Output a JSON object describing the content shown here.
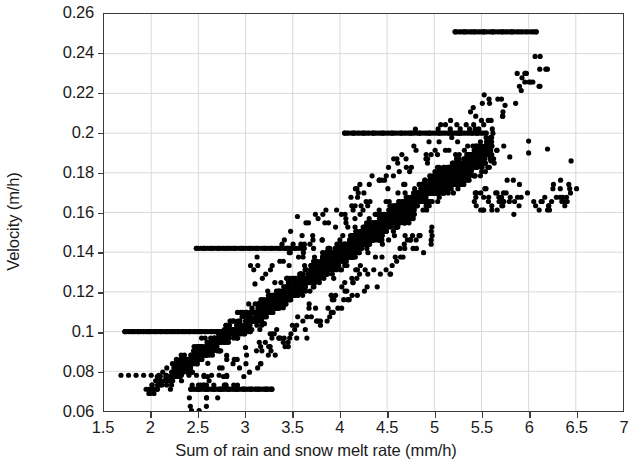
{
  "chart_data": {
    "type": "scatter",
    "title": "",
    "xlabel": "Sum of rain and snow melt rate (mm/h)",
    "ylabel": "Velocity (m/h)",
    "xlim": [
      1.5,
      7
    ],
    "ylim": [
      0.06,
      0.26
    ],
    "xticks": [
      1.5,
      2,
      2.5,
      3,
      3.5,
      4,
      4.5,
      5,
      5.5,
      6,
      6.5,
      7
    ],
    "xtick_labels": [
      "1.5",
      "2",
      "2.5",
      "3",
      "3.5",
      "4",
      "4.5",
      "5",
      "5.5",
      "6",
      "6.5",
      "7"
    ],
    "yticks": [
      0.06,
      0.08,
      0.1,
      0.12,
      0.14,
      0.16,
      0.18,
      0.2,
      0.22,
      0.24,
      0.26
    ],
    "ytick_labels": [
      "0.06",
      "0.08",
      "0.1",
      "0.12",
      "0.14",
      "0.16",
      "0.18",
      "0.2",
      "0.22",
      "0.24",
      "0.26"
    ],
    "grid": true,
    "legend": null,
    "marker": {
      "shape": "circle",
      "size_px": 5.2,
      "color": "#000000",
      "filled": true
    },
    "series": [
      {
        "name": "velocity vs rain and snow melt rate",
        "description": "Dense positively-correlated point cloud; velocity rises from about 0.07 m/h at 2 mm/h to about 0.20 m/h at 6 mm/h. Several horizontal quantization bands are visible at 0.251, 0.200, 0.142, 0.100 and 0.071 m/h.",
        "n_points_approx": 1900,
        "bands": [
          {
            "y": 0.251,
            "x_from": 5.22,
            "x_to": 6.08,
            "note": "saturated top band"
          },
          {
            "y": 0.2,
            "x_from": 4.05,
            "x_to": 5.55,
            "note": "dense flat band"
          },
          {
            "y": 0.142,
            "x_from": 2.48,
            "x_to": 3.62,
            "note": "flat band"
          },
          {
            "y": 0.1,
            "x_from": 1.72,
            "x_to": 3.05,
            "note": "flat band"
          },
          {
            "y": 0.071,
            "x_from": 2.42,
            "x_to": 3.28,
            "note": "lowest flat band"
          }
        ],
        "trend": {
          "type": "linear",
          "slope": 0.0335,
          "intercept": 0.0045
        },
        "points": [
          [
            1.72,
            0.1
          ],
          [
            1.8,
            0.1
          ],
          [
            1.86,
            0.1
          ],
          [
            1.92,
            0.1
          ],
          [
            1.98,
            0.1
          ],
          [
            2.04,
            0.1
          ],
          [
            2.1,
            0.1
          ],
          [
            2.16,
            0.1
          ],
          [
            2.22,
            0.1
          ],
          [
            2.28,
            0.1
          ],
          [
            2.34,
            0.1
          ],
          [
            2.4,
            0.1
          ],
          [
            2.46,
            0.1
          ],
          [
            2.52,
            0.1
          ],
          [
            2.58,
            0.1
          ],
          [
            2.64,
            0.1
          ],
          [
            2.7,
            0.1
          ],
          [
            2.76,
            0.1
          ],
          [
            2.82,
            0.1
          ],
          [
            2.88,
            0.1
          ],
          [
            2.94,
            0.1
          ],
          [
            3.0,
            0.1
          ],
          [
            3.05,
            0.1
          ],
          [
            1.68,
            0.078
          ],
          [
            1.76,
            0.078
          ],
          [
            1.84,
            0.078
          ],
          [
            1.92,
            0.078
          ],
          [
            2.0,
            0.078
          ],
          [
            2.08,
            0.078
          ],
          [
            2.16,
            0.078
          ],
          [
            2.24,
            0.078
          ],
          [
            2.32,
            0.078
          ],
          [
            2.4,
            0.078
          ],
          [
            2.48,
            0.078
          ],
          [
            2.56,
            0.078
          ],
          [
            2.64,
            0.078
          ],
          [
            2.72,
            0.078
          ],
          [
            2.8,
            0.078
          ],
          [
            2.42,
            0.071
          ],
          [
            2.5,
            0.071
          ],
          [
            2.58,
            0.071
          ],
          [
            2.66,
            0.071
          ],
          [
            2.74,
            0.071
          ],
          [
            2.82,
            0.071
          ],
          [
            2.9,
            0.071
          ],
          [
            2.98,
            0.071
          ],
          [
            3.06,
            0.071
          ],
          [
            3.14,
            0.071
          ],
          [
            3.22,
            0.071
          ],
          [
            3.28,
            0.071
          ],
          [
            2.48,
            0.142
          ],
          [
            2.56,
            0.142
          ],
          [
            2.64,
            0.142
          ],
          [
            2.72,
            0.142
          ],
          [
            2.8,
            0.142
          ],
          [
            2.88,
            0.142
          ],
          [
            2.96,
            0.142
          ],
          [
            3.04,
            0.142
          ],
          [
            3.12,
            0.142
          ],
          [
            3.2,
            0.142
          ],
          [
            3.28,
            0.142
          ],
          [
            3.36,
            0.142
          ],
          [
            3.44,
            0.142
          ],
          [
            3.52,
            0.142
          ],
          [
            3.62,
            0.142
          ],
          [
            4.05,
            0.2
          ],
          [
            4.15,
            0.2
          ],
          [
            4.25,
            0.2
          ],
          [
            4.35,
            0.2
          ],
          [
            4.45,
            0.2
          ],
          [
            4.55,
            0.2
          ],
          [
            4.65,
            0.2
          ],
          [
            4.75,
            0.2
          ],
          [
            4.85,
            0.2
          ],
          [
            4.95,
            0.2
          ],
          [
            5.05,
            0.2
          ],
          [
            5.15,
            0.2
          ],
          [
            5.25,
            0.2
          ],
          [
            5.4,
            0.2
          ],
          [
            5.55,
            0.2
          ],
          [
            5.22,
            0.251
          ],
          [
            5.32,
            0.251
          ],
          [
            5.42,
            0.251
          ],
          [
            5.52,
            0.251
          ],
          [
            5.62,
            0.251
          ],
          [
            5.72,
            0.251
          ],
          [
            5.82,
            0.251
          ],
          [
            6.08,
            0.251
          ],
          [
            2.6,
            0.084
          ],
          [
            2.8,
            0.088
          ],
          [
            3.0,
            0.092
          ],
          [
            3.2,
            0.104
          ],
          [
            3.4,
            0.112
          ],
          [
            3.6,
            0.12
          ],
          [
            3.8,
            0.128
          ],
          [
            4.0,
            0.136
          ],
          [
            4.2,
            0.144
          ],
          [
            4.4,
            0.152
          ],
          [
            4.6,
            0.16
          ],
          [
            4.8,
            0.168
          ],
          [
            5.0,
            0.172
          ],
          [
            5.2,
            0.178
          ],
          [
            5.4,
            0.182
          ],
          [
            5.6,
            0.186
          ],
          [
            5.8,
            0.188
          ],
          [
            6.0,
            0.19
          ],
          [
            6.2,
            0.192
          ],
          [
            6.45,
            0.186
          ],
          [
            5.75,
            0.214
          ],
          [
            4.8,
            0.202
          ],
          [
            6.0,
            0.196
          ],
          [
            3.55,
            0.158
          ],
          [
            3.1,
            0.124
          ]
        ]
      }
    ]
  },
  "axes": {
    "frame_color": "#3b3b3b",
    "grid_color": "#d9d9d9",
    "background": "#ffffff",
    "point_color": "#000000"
  }
}
